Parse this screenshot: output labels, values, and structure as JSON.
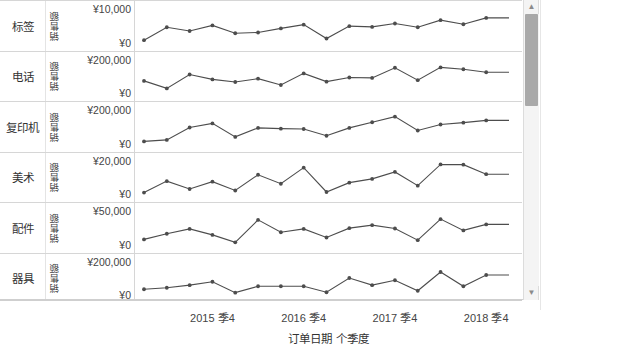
{
  "chart_data": {
    "type": "line",
    "title": "",
    "xlabel": "订单日期 个季度",
    "ylabel": "销售额",
    "grid": false,
    "legend_position": "right",
    "x_tick_labels": [
      "2015 季4",
      "2016 季4",
      "2017 季4",
      "2018 季4"
    ],
    "x_tick_index": [
      3,
      7,
      11,
      15
    ],
    "x_points": 17,
    "panels": [
      {
        "category": "标签",
        "measure": "销售额",
        "ylim": [
          0,
          10000
        ],
        "y_tick_hi": "¥10,000",
        "y_tick_lo": "¥0",
        "values": [
          1150,
          4600,
          3600,
          5100,
          3000,
          3200,
          4300,
          5300,
          1600,
          4900,
          4700,
          5600,
          4600,
          6500,
          5400,
          7100,
          7100
        ]
      },
      {
        "category": "电话",
        "measure": "销售额",
        "ylim": [
          0,
          200000
        ],
        "y_tick_hi": "¥200,000",
        "y_tick_lo": "¥0",
        "values": [
          78000,
          38000,
          112000,
          86000,
          72000,
          90000,
          56000,
          118000,
          74000,
          96000,
          94000,
          148000,
          82000,
          150000,
          140000,
          124000,
          124000
        ]
      },
      {
        "category": "复印机",
        "measure": "销售额",
        "ylim": [
          0,
          200000
        ],
        "y_tick_hi": "¥200,000",
        "y_tick_lo": "¥0",
        "values": [
          22000,
          30000,
          96000,
          118000,
          46000,
          94000,
          90000,
          88000,
          52000,
          94000,
          124000,
          154000,
          80000,
          112000,
          122000,
          134000,
          134000
        ]
      },
      {
        "category": "美术",
        "measure": "销售额",
        "ylim": [
          0,
          20000
        ],
        "y_tick_hi": "¥20,000",
        "y_tick_lo": "¥0",
        "values": [
          2100,
          8200,
          4000,
          7900,
          3200,
          11600,
          6800,
          15400,
          2400,
          7400,
          9400,
          13100,
          5800,
          17100,
          17000,
          11900,
          11900
        ]
      },
      {
        "category": "配件",
        "measure": "销售额",
        "ylim": [
          0,
          50000
        ],
        "y_tick_hi": "¥50,000",
        "y_tick_lo": "¥0",
        "values": [
          9500,
          17000,
          23500,
          15500,
          5600,
          35500,
          19000,
          23500,
          12000,
          24500,
          28500,
          24000,
          8500,
          36500,
          21500,
          29500,
          29500
        ]
      },
      {
        "category": "器具",
        "measure": "销售额",
        "ylim": [
          0,
          200000
        ],
        "y_tick_hi": "¥200,000",
        "y_tick_lo": "¥0",
        "values": [
          44000,
          52000,
          66000,
          84000,
          26000,
          60000,
          60000,
          60000,
          28000,
          104000,
          66000,
          92000,
          36000,
          136000,
          60000,
          120000,
          120000
        ]
      }
    ],
    "mark_color": "#4d4d4d",
    "line_color": "#4d4d4d"
  },
  "legend": {
    "title": "聚合(控制区间)",
    "items": [
      {
        "label": "Null",
        "color": "#4d4d4d"
      },
      {
        "label": "控制区间外",
        "color": "#9a9a9a"
      }
    ]
  },
  "scrollbar": {
    "up_arrow": "▲",
    "down_arrow": "▼"
  }
}
